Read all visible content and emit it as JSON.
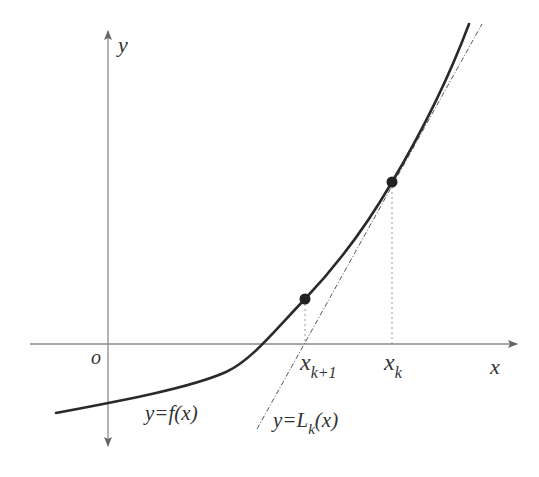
{
  "diagram": {
    "axes": {
      "x_label": "x",
      "y_label": "y",
      "origin_label": "o",
      "color": "#888888"
    },
    "curve": {
      "label_prefix": "y=",
      "label_func": "f(x)",
      "color": "#2a2a2a"
    },
    "tangent": {
      "label_prefix": "y=",
      "label_L": "L",
      "label_sub": "k",
      "label_suffix": "(x)",
      "color": "#555555"
    },
    "points": [
      {
        "name": "x_k",
        "label_main": "x",
        "label_sub": "k"
      },
      {
        "name": "x_k_plus_1",
        "label_main": "x",
        "label_sub": "k+1"
      }
    ],
    "point_color": "#222222"
  }
}
